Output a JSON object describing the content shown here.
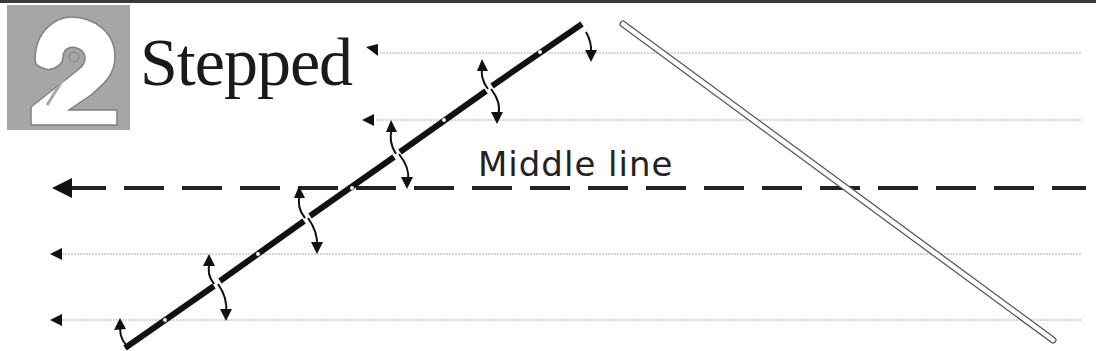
{
  "badge": {
    "number": "2",
    "background_color": "#a6a6a6",
    "numeral_color": "#ffffff"
  },
  "title": "Stepped",
  "middle_line": {
    "label": "Middle line",
    "y": 188,
    "style": "dashed",
    "arrow_direction": "left"
  },
  "guide_lines": [
    {
      "y": 53,
      "arrow_x": 372,
      "style": "dotted"
    },
    {
      "y": 120,
      "arrow_x": 368,
      "style": "dotted"
    },
    {
      "y": 254,
      "arrow_x": 55,
      "style": "dotted"
    },
    {
      "y": 320,
      "arrow_x": 55,
      "style": "dotted"
    }
  ],
  "stepped_line": {
    "start": [
      125,
      348
    ],
    "end": [
      582,
      24
    ],
    "break_points": [
      [
        217,
        283
      ],
      [
        307,
        218
      ],
      [
        397,
        154
      ],
      [
        489,
        88
      ]
    ],
    "dot_points": [
      [
        165,
        320
      ],
      [
        258,
        254
      ],
      [
        352,
        188
      ],
      [
        444,
        120
      ],
      [
        540,
        52
      ]
    ],
    "color": "#111111"
  },
  "ruler_line": {
    "start": [
      623,
      24
    ],
    "end": [
      1053,
      340
    ],
    "style": "double-outline"
  },
  "colors": {
    "ink": "#111111",
    "guide": "#c8c8c8",
    "topbar": "#3a3a3a"
  }
}
